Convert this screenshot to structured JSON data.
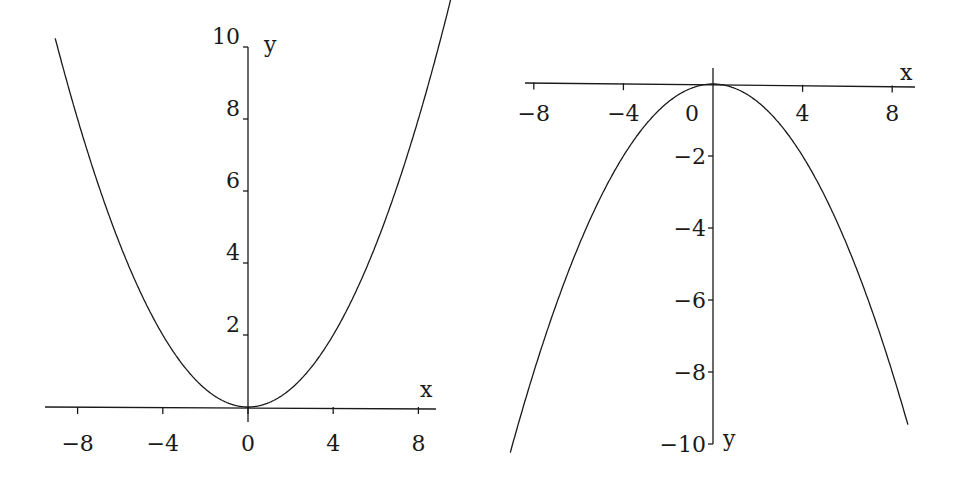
{
  "chart_data": [
    {
      "type": "line",
      "title": "",
      "function": "y = x^2 / 8",
      "xlabel": "x",
      "ylabel": "y",
      "xlim": [
        -9.2,
        9.6
      ],
      "ylim": [
        0,
        10
      ],
      "xticks": [
        -8,
        -4,
        0,
        4,
        8
      ],
      "xtick_labels": [
        "−8",
        "−4",
        "0",
        "4",
        "8"
      ],
      "yticks": [
        2,
        4,
        6,
        8,
        10
      ],
      "ytick_labels": [
        "2",
        "4",
        "6",
        "8",
        "10"
      ],
      "grid": false,
      "legend": null,
      "series": [
        {
          "name": "parabola opening up",
          "x": [
            -9,
            -8,
            -6,
            -4,
            -2,
            0,
            2,
            4,
            6,
            8,
            9
          ],
          "y": [
            10.125,
            8,
            4.5,
            2,
            0.5,
            0,
            0.5,
            2,
            4.5,
            8,
            10.125
          ]
        }
      ]
    },
    {
      "type": "line",
      "title": "",
      "function": "y = -x^2 / 8",
      "xlabel": "x",
      "ylabel": "y",
      "xlim": [
        -8.9,
        8.9
      ],
      "ylim": [
        -10,
        0
      ],
      "xticks": [
        -8,
        -4,
        0,
        4,
        8
      ],
      "xtick_labels": [
        "−8",
        "−4",
        "0",
        "4",
        "8"
      ],
      "yticks": [
        -2,
        -4,
        -6,
        -8,
        -10
      ],
      "ytick_labels": [
        "−2",
        "−4",
        "−6",
        "−8",
        "−10"
      ],
      "grid": false,
      "legend": null,
      "series": [
        {
          "name": "parabola opening down",
          "x": [
            -9,
            -8,
            -6,
            -4,
            -2,
            0,
            2,
            4,
            6,
            8,
            9
          ],
          "y": [
            -10.125,
            -8,
            -4.5,
            -2,
            -0.5,
            0,
            -0.5,
            -2,
            -4.5,
            -8,
            -10.125
          ]
        }
      ]
    }
  ],
  "left": {
    "x_label": "x",
    "y_label": "y",
    "x_ticks": [
      {
        "v": -8,
        "label": "−8"
      },
      {
        "v": -4,
        "label": "−4"
      },
      {
        "v": 0,
        "label": "0"
      },
      {
        "v": 4,
        "label": "4"
      },
      {
        "v": 8,
        "label": "8"
      }
    ],
    "y_ticks": [
      {
        "v": 2,
        "label": "2"
      },
      {
        "v": 4,
        "label": "4"
      },
      {
        "v": 6,
        "label": "6"
      },
      {
        "v": 8,
        "label": "8"
      },
      {
        "v": 10,
        "label": "10"
      }
    ]
  },
  "right": {
    "x_label": "x",
    "y_label": "y",
    "x_ticks": [
      {
        "v": -8,
        "label": "−8"
      },
      {
        "v": -4,
        "label": "−4"
      },
      {
        "v": 0,
        "label": "0"
      },
      {
        "v": 4,
        "label": "4"
      },
      {
        "v": 8,
        "label": "8"
      }
    ],
    "y_ticks": [
      {
        "v": -2,
        "label": "−2"
      },
      {
        "v": -4,
        "label": "−4"
      },
      {
        "v": -6,
        "label": "−6"
      },
      {
        "v": -8,
        "label": "−8"
      },
      {
        "v": -10,
        "label": "−10"
      }
    ]
  },
  "colors": {
    "line": "#1a1a1a",
    "background": "#ffffff"
  }
}
